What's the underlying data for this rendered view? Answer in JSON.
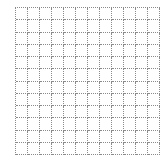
{
  "grid": {
    "columns": 12,
    "rows": 12,
    "line_style": "dotted",
    "line_color": "#8a8a8a",
    "background_color": "#ffffff",
    "cell_size_px": 12
  }
}
